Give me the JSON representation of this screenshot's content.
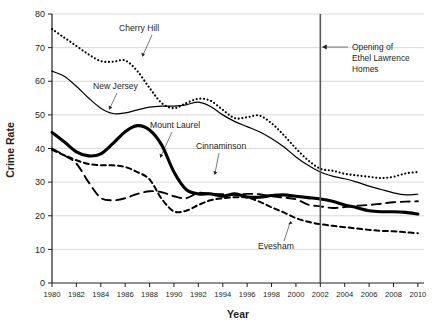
{
  "chart_data": {
    "type": "line",
    "title": "",
    "xlabel": "Year",
    "ylabel": "Crime Rate",
    "xlim": [
      1980,
      2010.5
    ],
    "ylim": [
      0,
      80
    ],
    "grid": true,
    "legend_position": "inline-labels",
    "xticks": [
      1980,
      1982,
      1984,
      1986,
      1988,
      1990,
      1992,
      1994,
      1996,
      1998,
      2000,
      2002,
      2004,
      2006,
      2008,
      2010
    ],
    "xtick_labels": [
      "1980",
      "1982",
      "1984",
      "1986",
      "1988",
      "1990",
      "1992",
      "1994",
      "1996",
      "1998",
      "2000",
      "2002",
      "2004",
      "2006",
      "2008",
      "2010"
    ],
    "yticks": [
      0,
      10,
      20,
      30,
      40,
      50,
      60,
      70,
      80
    ],
    "ytick_labels": [
      "0",
      "10",
      "20",
      "30",
      "40",
      "50",
      "60",
      "70",
      "80"
    ],
    "x": [
      1980,
      1981,
      1982,
      1983,
      1984,
      1985,
      1986,
      1987,
      1988,
      1989,
      1990,
      1991,
      1992,
      1993,
      1994,
      1995,
      1996,
      1997,
      1998,
      1999,
      2000,
      2001,
      2002,
      2003,
      2004,
      2005,
      2006,
      2007,
      2008,
      2009,
      2010
    ],
    "series": [
      {
        "name": "Cherry Hill",
        "style": "dotted",
        "width": 2.1,
        "values": [
          75.5,
          73.0,
          70.5,
          68.0,
          66.0,
          65.8,
          66.2,
          63.0,
          58.0,
          53.5,
          52.0,
          53.5,
          54.8,
          54.2,
          51.5,
          49.0,
          49.3,
          49.8,
          47.5,
          44.0,
          40.0,
          36.5,
          34.0,
          33.4,
          32.5,
          32.0,
          31.6,
          31.2,
          31.6,
          32.6,
          33.0
        ]
      },
      {
        "name": "New Jersey",
        "style": "solid-thin",
        "width": 1.2,
        "values": [
          63.0,
          61.5,
          58.5,
          55.0,
          52.0,
          50.4,
          50.6,
          51.5,
          52.3,
          52.6,
          52.6,
          53.0,
          53.8,
          52.5,
          50.0,
          48.0,
          46.5,
          45.0,
          43.0,
          40.5,
          37.5,
          35.0,
          33.0,
          31.8,
          31.0,
          30.0,
          28.8,
          27.8,
          26.8,
          26.2,
          26.4
        ]
      },
      {
        "name": "Mount Laurel",
        "style": "solid-thick",
        "width": 3.1,
        "values": [
          44.8,
          42.0,
          39.0,
          37.8,
          38.4,
          41.5,
          45.0,
          46.8,
          45.5,
          41.0,
          33.0,
          27.8,
          26.5,
          26.5,
          25.8,
          26.5,
          25.6,
          25.5,
          26.0,
          26.2,
          25.8,
          25.4,
          25.0,
          24.3,
          23.2,
          22.4,
          21.5,
          21.2,
          21.2,
          21.0,
          20.5
        ]
      },
      {
        "name": "Cinnaminson",
        "style": "dashed-long",
        "width": 1.9,
        "values": [
          40.0,
          38.0,
          35.5,
          30.0,
          25.3,
          24.6,
          25.2,
          26.5,
          27.3,
          27.0,
          25.8,
          25.2,
          26.8,
          26.5,
          26.4,
          26.2,
          26.5,
          26.4,
          25.8,
          25.4,
          24.9,
          23.3,
          22.8,
          22.3,
          22.6,
          23.0,
          23.2,
          23.6,
          24.0,
          24.2,
          24.3
        ]
      },
      {
        "name": "Evesham",
        "style": "dashed-short",
        "width": 2.0,
        "values": [
          39.6,
          38.0,
          36.5,
          35.4,
          35.0,
          35.0,
          34.5,
          33.0,
          30.8,
          25.0,
          21.3,
          21.5,
          23.2,
          24.6,
          25.2,
          25.5,
          25.4,
          24.2,
          22.5,
          21.0,
          19.3,
          18.2,
          17.5,
          17.0,
          16.6,
          16.2,
          15.8,
          15.5,
          15.4,
          15.1,
          14.8
        ]
      }
    ],
    "annotations": [
      {
        "name": "event-marker",
        "x": 2002,
        "label": "Opening of\nEthel Lawrence\nHomes",
        "label_line_1": "Opening of",
        "label_line_2": "Ethel Lawrence",
        "label_line_3": "Homes"
      }
    ]
  },
  "axes": {
    "y_title": "Crime Rate",
    "x_title": "Year"
  },
  "series_labels": {
    "cherry_hill": "Cherry Hill",
    "new_jersey": "New Jersey",
    "mount_laurel": "Mount Laurel",
    "cinnaminson": "Cinnaminson",
    "evesham": "Evesham"
  },
  "annotation": {
    "line1": "Opening of",
    "line2": "Ethel Lawrence",
    "line3": "Homes"
  },
  "ytick_labels": {
    "t0": "0",
    "t1": "10",
    "t2": "20",
    "t3": "30",
    "t4": "40",
    "t5": "50",
    "t6": "60",
    "t7": "70",
    "t8": "80"
  },
  "xtick_labels": {
    "t1980": "1980",
    "t1982": "1982",
    "t1984": "1984",
    "t1986": "1986",
    "t1988": "1988",
    "t1990": "1990",
    "t1992": "1992",
    "t1994": "1994",
    "t1996": "1996",
    "t1998": "1998",
    "t2000": "2000",
    "t2002": "2002",
    "t2004": "2004",
    "t2006": "2006",
    "t2008": "2008",
    "t2010": "2010"
  },
  "colors": {
    "ink": "#231f20",
    "grid": "#c9c9c4",
    "event_line": "#57575a",
    "background": "#ffffff"
  }
}
